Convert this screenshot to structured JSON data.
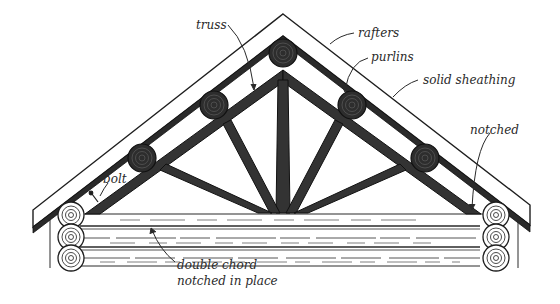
{
  "diagram": {
    "labels": {
      "truss": "truss",
      "rafters": "rafters",
      "purlins": "purlins",
      "solid_sheathing": "solid sheathing",
      "notched": "notched",
      "bolt": "bolt",
      "double_chord_line1": "double chord",
      "double_chord_line2": "notched in place"
    },
    "colors": {
      "ink": "#1e1e1e",
      "timber": "#3a3a3a",
      "paper": "#ffffff"
    }
  }
}
